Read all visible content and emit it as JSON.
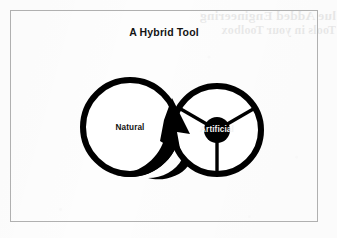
{
  "page": {
    "background_color": "#fdfdfd",
    "frame_color": "#b0b0b0"
  },
  "figure": {
    "title": "A Hybrid Tool",
    "ink_color": "#000000"
  },
  "bleed_through": {
    "line1": "lue Added Engineering",
    "line2": "Tools in your Toolbox"
  },
  "diagram": {
    "type": "venn-merge-concept",
    "nodes": [
      {
        "id": "natural",
        "label": "Natural",
        "shape": "circle-outline",
        "cx": 120,
        "cy": 117,
        "r": 47,
        "stroke_width": 6,
        "stroke_color": "#000000",
        "fill_color": "#ffffff",
        "label_color": "#101010"
      },
      {
        "id": "artificial",
        "label": "Artificial",
        "shape": "spoked-wheel",
        "cx": 207,
        "cy": 120,
        "r": 44,
        "stroke_width": 6,
        "stroke_color": "#000000",
        "fill_color": "#ffffff",
        "hub_radius": 13,
        "hub_color": "#000000",
        "spokes": 3,
        "spoke_angles_deg": [
          210,
          330,
          90
        ],
        "label_color": "#f2f2f2"
      }
    ],
    "connector": {
      "id": "merge-arrow",
      "from": "artificial",
      "to": "natural",
      "style": "solid-filled-arrowhead",
      "direction": "right-to-left",
      "color": "#000000"
    }
  }
}
